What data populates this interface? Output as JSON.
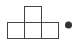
{
  "icon": {
    "name": "tetromino-t-with-dot",
    "stroke_color": "#444444",
    "dot_color": "#333333",
    "background": "#ffffff"
  }
}
